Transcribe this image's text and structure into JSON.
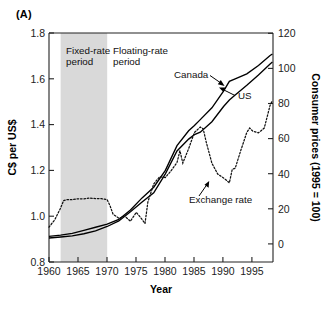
{
  "panel": {
    "label": "(A)"
  },
  "axes": {
    "left": {
      "title": "C$ per US$",
      "ticks": [
        "0.8",
        "1.0",
        "1.2",
        "1.4",
        "1.6",
        "1.8"
      ],
      "min": 0.8,
      "max": 1.8
    },
    "right": {
      "title": "Consumer prices (1995 = 100)",
      "ticks": [
        "0",
        "20",
        "40",
        "60",
        "80",
        "100",
        "120"
      ],
      "min": 0,
      "max": 120
    },
    "bottom": {
      "title": "Year",
      "ticks": [
        "1960",
        "1965",
        "1970",
        "1975",
        "1980",
        "1985",
        "1990",
        "1995"
      ],
      "min": 1960,
      "max": 1998.5
    }
  },
  "annotations": {
    "fixed_period_line1": "Fixed-rate",
    "fixed_period_line2": "period",
    "floating_period_line1": "Floating-rate",
    "floating_period_line2": "period",
    "canada": "Canada",
    "us": "US",
    "exchange_rate": "Exchange rate"
  },
  "shading": {
    "label": "fixed-rate-period-band",
    "color": "#d9d9d9",
    "start_year": 1962,
    "end_year": 1970
  },
  "chart_data": {
    "type": "line",
    "title": "",
    "xlabel": "Year",
    "ylabel": "C$ per US$",
    "y2label": "Consumer prices (1995 = 100)",
    "xlim": [
      1960,
      1998.5
    ],
    "ylim": [
      0.8,
      1.8
    ],
    "y2lim": [
      0,
      120
    ],
    "grid": false,
    "legend": "inline-annotations",
    "shaded_region": {
      "name": "Fixed-rate period",
      "x_start": 1962,
      "x_end": 1970
    },
    "series": [
      {
        "name": "Exchange rate",
        "axis": "left",
        "style": "dotted",
        "x": [
          1960,
          1961,
          1962,
          1962.5,
          1963,
          1964,
          1965,
          1966,
          1967,
          1968,
          1969,
          1970,
          1970.5,
          1971,
          1972,
          1973,
          1974,
          1975,
          1976,
          1976.5,
          1977,
          1978,
          1979,
          1980,
          1981,
          1982,
          1982.5,
          1983,
          1984,
          1985,
          1986,
          1986.5,
          1987,
          1988,
          1989,
          1990,
          1991,
          1991.5,
          1992,
          1993,
          1994,
          1994.5,
          1995,
          1996,
          1997,
          1998,
          1998.4
        ],
        "y": [
          0.952,
          0.985,
          1.036,
          1.068,
          1.072,
          1.072,
          1.076,
          1.076,
          1.079,
          1.077,
          1.077,
          1.072,
          1.045,
          1.009,
          0.991,
          1.0,
          0.978,
          1.017,
          0.986,
          0.968,
          1.063,
          1.141,
          1.172,
          1.169,
          1.199,
          1.234,
          1.286,
          1.232,
          1.295,
          1.366,
          1.389,
          1.382,
          1.326,
          1.231,
          1.184,
          1.167,
          1.146,
          1.205,
          1.209,
          1.29,
          1.366,
          1.385,
          1.372,
          1.364,
          1.385,
          1.484,
          1.505
        ]
      },
      {
        "name": "Canada",
        "axis": "right",
        "style": "solid",
        "x": [
          1960,
          1962,
          1964,
          1966,
          1968,
          1970,
          1972,
          1974,
          1976,
          1978,
          1980,
          1982,
          1984,
          1985,
          1986,
          1988,
          1990,
          1991,
          1992,
          1994,
          1996,
          1998,
          1998.4
        ],
        "y": [
          13.4,
          14.1,
          15.0,
          16.6,
          18.2,
          19.8,
          22.3,
          27.3,
          33.6,
          39.2,
          48.0,
          61.0,
          68.8,
          71.5,
          74.6,
          80.8,
          89.6,
          94.7,
          96.0,
          98.6,
          103.0,
          108.2,
          109.0
        ]
      },
      {
        "name": "US",
        "axis": "right",
        "style": "solid",
        "x": [
          1960,
          1962,
          1964,
          1966,
          1968,
          1970,
          1972,
          1974,
          1976,
          1978,
          1980,
          1982,
          1984,
          1985,
          1986,
          1988,
          1990,
          1991,
          1992,
          1994,
          1996,
          1998,
          1998.4
        ],
        "y": [
          12.6,
          13.1,
          13.7,
          14.8,
          16.3,
          18.6,
          21.5,
          26.3,
          31.4,
          36.3,
          46.2,
          58.2,
          64.4,
          66.7,
          68.0,
          73.5,
          81.5,
          84.9,
          87.5,
          92.6,
          98.0,
          103.8,
          104.8
        ]
      }
    ]
  }
}
